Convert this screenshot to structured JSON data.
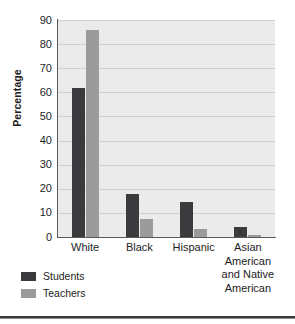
{
  "chart_data": {
    "type": "bar",
    "title": "",
    "xlabel": "",
    "ylabel": "Percentage",
    "ylim": [
      0,
      90
    ],
    "ytick_step": 10,
    "yticks": [
      "90",
      "80",
      "70",
      "60",
      "50",
      "40",
      "30",
      "20",
      "10",
      "0"
    ],
    "grid": true,
    "legend_position": "below-left",
    "categories": [
      "White",
      "Black",
      "Hispanic",
      "Asian American and Native American"
    ],
    "category_lines": [
      [
        "White"
      ],
      [
        "Black"
      ],
      [
        "Hispanic"
      ],
      [
        "Asian",
        "American",
        "and Native",
        "American"
      ]
    ],
    "series": [
      {
        "name": "Students",
        "color": "#3b3b3d",
        "values": [
          62,
          18,
          14.5,
          4
        ]
      },
      {
        "name": "Teachers",
        "color": "#9b9b9b",
        "values": [
          86,
          7.5,
          3.5,
          1
        ]
      }
    ],
    "colors": {
      "students": "#3b3b3d",
      "teachers": "#9b9b9b",
      "plot_background": "#ebebeb",
      "gridline": "#cfcfcf",
      "axis": "#58585a",
      "text": "#1d1d1d"
    }
  }
}
